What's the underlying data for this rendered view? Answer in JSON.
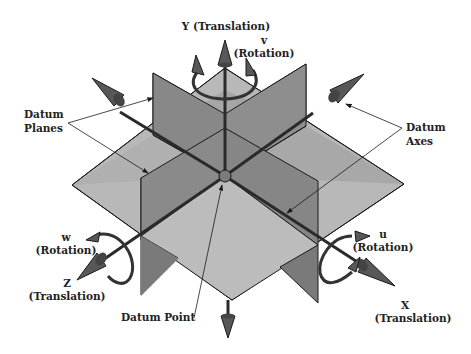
{
  "diagram": {
    "colors": {
      "plane_light": "#b4b4b4",
      "plane_mid": "#9a9a9a",
      "plane_dark": "#7e7e7e",
      "axis": "#2a2a2a",
      "cone": "#585858",
      "outline": "#1a1a1a"
    },
    "labels": {
      "y_axis": "Y (Translation)",
      "v_symbol": "v",
      "v_rotation": "(Rotation)",
      "datum_planes_1": "Datum",
      "datum_planes_2": "Planes",
      "datum_axes_1": "Datum",
      "datum_axes_2": "Axes",
      "w_symbol": "w",
      "w_rotation": "(Rotation)",
      "z_symbol": "Z",
      "z_translation": "(Translation)",
      "u_symbol": "u",
      "u_rotation": "(Rotation)",
      "x_symbol": "X",
      "x_translation": "(Translation)",
      "datum_point": "Datum Point"
    }
  }
}
